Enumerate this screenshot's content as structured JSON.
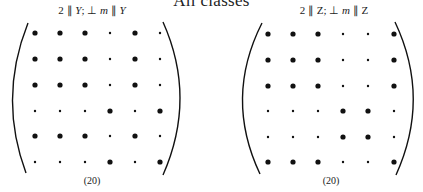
{
  "title": "All classes",
  "panels": [
    {
      "label_parts": [
        "2 ∥ ",
        "Y",
        "; ⊥ ",
        "m",
        " ∥ ",
        "Y"
      ],
      "label_italic": [
        false,
        true,
        false,
        true,
        false,
        true
      ],
      "equation_number": "(20)",
      "matrix": [
        [
          "L",
          "L",
          "L",
          "s",
          "L",
          "s"
        ],
        [
          "L",
          "L",
          "L",
          "s",
          "L",
          "s"
        ],
        [
          "L",
          "L",
          "L",
          "s",
          "L",
          "s"
        ],
        [
          "s",
          "s",
          "s",
          "L",
          "s",
          "L"
        ],
        [
          "L",
          "L",
          "L",
          "s",
          "L",
          "s"
        ],
        [
          "s",
          "s",
          "s",
          "L",
          "s",
          "L"
        ]
      ]
    },
    {
      "label_parts": [
        "2 ∥ Z; ⊥ ",
        "m",
        " ∥ Z"
      ],
      "label_italic": [
        false,
        true,
        false
      ],
      "equation_number": "(20)",
      "matrix": [
        [
          "L",
          "L",
          "L",
          "s",
          "s",
          "L"
        ],
        [
          "L",
          "L",
          "L",
          "s",
          "s",
          "L"
        ],
        [
          "L",
          "L",
          "L",
          "s",
          "s",
          "L"
        ],
        [
          "s",
          "s",
          "s",
          "L",
          "L",
          "s"
        ],
        [
          "s",
          "s",
          "s",
          "L",
          "L",
          "s"
        ],
        [
          "L",
          "L",
          "L",
          "s",
          "s",
          "L"
        ]
      ]
    }
  ],
  "legend": {
    "L": "large dot (nonzero block entry)",
    "s": "small dot (zero entry)"
  },
  "colors": {
    "ink": "#111111"
  }
}
